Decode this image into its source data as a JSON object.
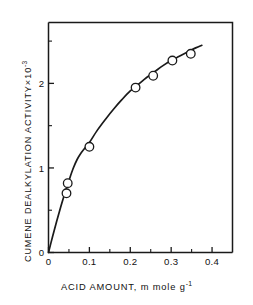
{
  "chart_data": {
    "type": "line",
    "title": "",
    "xlabel": "ACID AMOUNT, m mole g",
    "xlabel_exponent": "-1",
    "ylabel": "CUMENE DEALKYLATION ACTIVITY",
    "ylabel_times": "×",
    "ylabel_scale": "10",
    "ylabel_exponent": "-3",
    "xlim": [
      0,
      0.45
    ],
    "ylim": [
      0,
      2.72
    ],
    "xticks": [
      0,
      0.1,
      0.2,
      0.3,
      0.4
    ],
    "xtick_labels": [
      "0",
      "0.1",
      "0.2",
      "0.3",
      "0.4"
    ],
    "xminor_ticks": [
      0.05,
      0.15,
      0.25,
      0.35
    ],
    "yticks": [
      0,
      1,
      2
    ],
    "ytick_labels": [
      "0",
      "1",
      "2"
    ],
    "yminor_ticks": [
      0.5,
      1.5,
      2.5
    ],
    "grid": false,
    "legend": null,
    "marker": "open-circle",
    "series": [
      {
        "name": "Cumene dealkylation activity",
        "x": [
          0.044,
          0.047,
          0.1,
          0.213,
          0.256,
          0.303,
          0.348
        ],
        "y": [
          0.7,
          0.82,
          1.25,
          1.95,
          2.09,
          2.27,
          2.35
        ]
      }
    ],
    "fit_curve": {
      "description": "smooth saturating curve through origin",
      "x": [
        0,
        0.01,
        0.02,
        0.03,
        0.04,
        0.05,
        0.06,
        0.07,
        0.08,
        0.09,
        0.1,
        0.12,
        0.14,
        0.16,
        0.18,
        0.2,
        0.22,
        0.24,
        0.26,
        0.28,
        0.3,
        0.32,
        0.34,
        0.36,
        0.375
      ],
      "y": [
        0.0,
        0.19,
        0.37,
        0.54,
        0.7,
        0.85,
        0.99,
        1.1,
        1.18,
        1.24,
        1.3,
        1.45,
        1.58,
        1.7,
        1.81,
        1.91,
        1.99,
        2.07,
        2.14,
        2.21,
        2.27,
        2.32,
        2.37,
        2.42,
        2.45
      ]
    }
  },
  "axes": {
    "frame_color": "#1a1a1a",
    "curve_color": "#1a1a1a",
    "marker_fill": "#ffffff",
    "marker_stroke": "#1a1a1a",
    "background": "#ffffff"
  }
}
